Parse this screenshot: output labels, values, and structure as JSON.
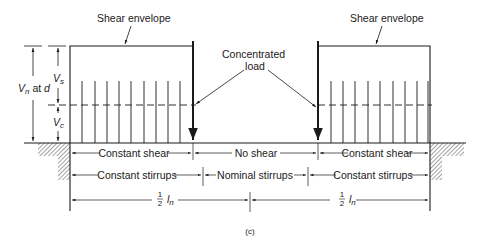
{
  "figure": {
    "caption": "(c)",
    "colors": {
      "ink": "#1a1a1a",
      "hatch": "#333333",
      "background": "#ffffff"
    }
  },
  "annotations": {
    "shear_envelope_left": "Shear envelope",
    "shear_envelope_right": "Shear envelope",
    "concentrated_load_line1": "Concentrated",
    "concentrated_load_line2": "load"
  },
  "left_dimensions": {
    "vn_label": "V",
    "vn_sub": "n",
    "vn_suffix": " at ",
    "vn_d": "d",
    "vs_label": "V",
    "vs_sub": "s",
    "vc_label": "V",
    "vc_sub": "c"
  },
  "rows": {
    "shear": [
      {
        "label": "Constant shear"
      },
      {
        "label": "No shear"
      },
      {
        "label": "Constant shear"
      }
    ],
    "stirrups": [
      {
        "label": "Constant stirrups"
      },
      {
        "label": "Nominal stirrups"
      },
      {
        "label": "Constant stirrups"
      }
    ],
    "span": [
      {
        "frac_num": "1",
        "frac_den": "2",
        "symbol": "l",
        "sub": "n"
      },
      {
        "frac_num": "1",
        "frac_den": "2",
        "symbol": "l",
        "sub": "n"
      }
    ]
  },
  "stirrups": {
    "left_x": [
      82,
      95,
      107,
      119,
      131,
      144,
      156,
      168,
      180
    ],
    "right_x": [
      331,
      343,
      355,
      368,
      380,
      393,
      405,
      417,
      428
    ]
  }
}
